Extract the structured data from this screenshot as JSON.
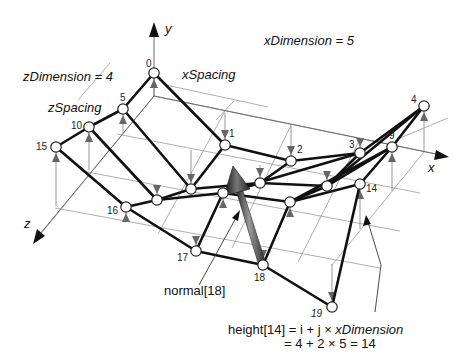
{
  "annotations": {
    "x_dimension": "xDimension = 5",
    "z_dimension": "zDimension = 4",
    "x_spacing": "xSpacing",
    "z_spacing": "zSpacing",
    "normal_label": "normal[18]",
    "height_line1_prefix": "height[14] = ",
    "height_line1_expr": " i +  j × ",
    "height_line1_var": "xDimension",
    "height_line2": "= 4 + 2 × 5 = 14"
  },
  "axes": {
    "x_label": "x",
    "y_label": "y",
    "z_label": "z"
  },
  "colors": {
    "edge": "#111111",
    "grid": "#9a9a9a",
    "node_fill": "#ffffff",
    "normal_arrow": "#4a4a4a",
    "height_arrow": "#666666"
  },
  "grid": {
    "x_dimension": 5,
    "z_dimension": 4
  },
  "nodes": [
    {
      "id": "0",
      "x": 154,
      "y": 73,
      "base_y": 96,
      "lx": 146,
      "ly": 67,
      "italic": false
    },
    {
      "id": "1",
      "x": 225,
      "y": 145,
      "base_y": 113,
      "lx": 229,
      "ly": 137,
      "italic": false
    },
    {
      "id": "2",
      "x": 291,
      "y": 161,
      "base_y": 126,
      "lx": 297,
      "ly": 153,
      "italic": false
    },
    {
      "id": "3",
      "x": 360,
      "y": 153,
      "base_y": 138,
      "lx": 349,
      "ly": 148,
      "italic": false
    },
    {
      "id": "4",
      "x": 424,
      "y": 106,
      "base_y": 151,
      "lx": 411,
      "ly": 103,
      "italic": false
    },
    {
      "id": "5",
      "x": 123,
      "y": 109,
      "base_y": 133,
      "lx": 120,
      "ly": 101,
      "italic": false
    },
    {
      "id": "6",
      "x": 191,
      "y": 189,
      "base_y": 150,
      "lx": 0,
      "ly": 0,
      "italic": false,
      "nolabel": true
    },
    {
      "id": "7",
      "x": 260,
      "y": 183,
      "base_y": 165,
      "lx": 0,
      "ly": 0,
      "italic": false,
      "nolabel": true
    },
    {
      "id": "8",
      "x": 327,
      "y": 186,
      "base_y": 178,
      "lx": 0,
      "ly": 0,
      "italic": false,
      "nolabel": true
    },
    {
      "id": "9",
      "x": 392,
      "y": 147,
      "base_y": 191,
      "lx": 389,
      "ly": 139,
      "italic": false
    },
    {
      "id": "10",
      "x": 89,
      "y": 127,
      "base_y": 170,
      "lx": 71,
      "ly": 129,
      "italic": false
    },
    {
      "id": "11",
      "x": 157,
      "y": 200,
      "base_y": 186,
      "lx": 0,
      "ly": 0,
      "italic": false,
      "nolabel": true
    },
    {
      "id": "12",
      "x": 223,
      "y": 193,
      "base_y": 200,
      "lx": 0,
      "ly": 0,
      "italic": false,
      "nolabel": true
    },
    {
      "id": "13",
      "x": 290,
      "y": 202,
      "base_y": 215,
      "lx": 0,
      "ly": 0,
      "italic": false,
      "nolabel": true
    },
    {
      "id": "14",
      "x": 360,
      "y": 184,
      "base_y": 229,
      "lx": 366,
      "ly": 192,
      "italic": false
    },
    {
      "id": "15",
      "x": 56,
      "y": 147,
      "base_y": 206,
      "lx": 36,
      "ly": 150,
      "italic": false
    },
    {
      "id": "16",
      "x": 126,
      "y": 207,
      "base_y": 221,
      "lx": 107,
      "ly": 214,
      "italic": false
    },
    {
      "id": "17",
      "x": 196,
      "y": 251,
      "base_y": 236,
      "lx": 177,
      "ly": 261,
      "italic": false
    },
    {
      "id": "18",
      "x": 263,
      "y": 265,
      "base_y": 250,
      "lx": 254,
      "ly": 281,
      "italic": false
    },
    {
      "id": "19",
      "x": 332,
      "y": 307,
      "base_y": 264,
      "lx": 311,
      "ly": 317,
      "italic": true
    }
  ],
  "edges": [
    [
      "0",
      "1"
    ],
    [
      "1",
      "2"
    ],
    [
      "2",
      "3"
    ],
    [
      "3",
      "4"
    ],
    [
      "5",
      "6"
    ],
    [
      "6",
      "7"
    ],
    [
      "7",
      "8"
    ],
    [
      "8",
      "9"
    ],
    [
      "10",
      "11"
    ],
    [
      "11",
      "12"
    ],
    [
      "12",
      "13"
    ],
    [
      "13",
      "14"
    ],
    [
      "15",
      "16"
    ],
    [
      "16",
      "17"
    ],
    [
      "17",
      "18"
    ],
    [
      "18",
      "19"
    ],
    [
      "0",
      "5"
    ],
    [
      "5",
      "10"
    ],
    [
      "10",
      "15"
    ],
    [
      "1",
      "6"
    ],
    [
      "6",
      "11"
    ],
    [
      "11",
      "16"
    ],
    [
      "2",
      "7"
    ],
    [
      "7",
      "12"
    ],
    [
      "12",
      "17"
    ],
    [
      "3",
      "8"
    ],
    [
      "8",
      "13"
    ],
    [
      "13",
      "18"
    ],
    [
      "4",
      "9"
    ],
    [
      "9",
      "14"
    ],
    [
      "14",
      "19"
    ],
    [
      "3",
      "12"
    ],
    [
      "4",
      "8"
    ],
    [
      "9",
      "13"
    ],
    [
      "12",
      "7"
    ]
  ]
}
